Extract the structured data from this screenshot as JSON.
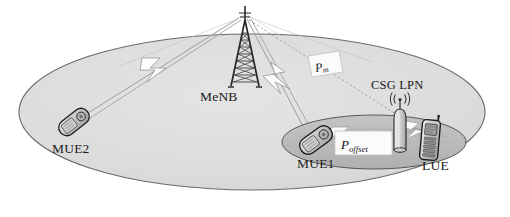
{
  "figure": {
    "type": "network-coverage-diagram"
  },
  "colors": {
    "macro_cell_fill": "#dddddd",
    "macro_cell_stroke": "#5a5a5a",
    "csg_cell_fill": "#b9b9b9",
    "csg_cell_stroke": "#4a4a4a",
    "link_line": "#8a8a8a",
    "dotted_line": "#9a9a9a",
    "bolt_fill": "#fdfdfd",
    "bolt_stroke": "#9b9b9b",
    "device_body": "#bdbdbd",
    "device_outline": "#1b1b1b",
    "tower": "#2a2a2a",
    "banner_fill": "#fbfbfb",
    "banner_stroke": "#bdbdbd",
    "text": "#1a1a1a"
  },
  "nodes": {
    "menb": {
      "label": "MeNB",
      "icon": "lattice-tower-icon",
      "role": "macro-base-station"
    },
    "csg_lpn": {
      "label": "CSG LPN",
      "icon": "broadcast-antenna-icon",
      "role": "closed-subscriber-group-low-power-node"
    },
    "mue1": {
      "label": "MUE1",
      "icon": "flip-phone-icon",
      "role": "macro-user-equipment"
    },
    "mue2": {
      "label": "MUE2",
      "icon": "flip-phone-icon",
      "role": "macro-user-equipment"
    },
    "lue": {
      "label": "LUE",
      "icon": "bar-phone-icon",
      "role": "lpn-user-equipment"
    }
  },
  "annotations": {
    "p_m": {
      "base": "P",
      "sub": "m",
      "on": "menb-to-csg-link"
    },
    "p_offset": {
      "base": "P",
      "sub": "offset",
      "on": "csg-range-expansion"
    }
  },
  "links": [
    {
      "name": "menb-to-mue2",
      "from": "menb",
      "to": "mue2",
      "style": "solid-beam",
      "marker": "lightning-bolt"
    },
    {
      "name": "menb-to-mue1",
      "from": "menb",
      "to": "mue1",
      "style": "solid-beam",
      "marker": "lightning-bolt"
    },
    {
      "name": "menb-to-csg",
      "from": "menb",
      "to": "csg_lpn",
      "style": "dotted",
      "marker": "none"
    },
    {
      "name": "csg-to-lue",
      "from": "csg_lpn",
      "to": "lue",
      "style": "beam",
      "marker": "lightning-bolt"
    },
    {
      "name": "csg-to-mue1",
      "from": "csg_lpn",
      "to": "mue1",
      "style": "beam",
      "marker": "lightning-bolt"
    }
  ],
  "regions": {
    "macro_cell": {
      "name": "macro-cell-coverage",
      "label": ""
    },
    "csg_cell": {
      "name": "csg-lpn-coverage",
      "label": ""
    }
  }
}
